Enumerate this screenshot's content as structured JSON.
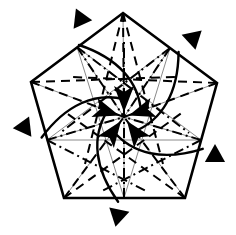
{
  "figure": {
    "shape": "regular pentagon",
    "background_color": "#ffffff",
    "ink_color": "#000000",
    "reference_line_color": "#8a8a8a",
    "symmetry": "5-fold rotational"
  },
  "diagram_data": {
    "type": "diagram",
    "canvas": {
      "width": 236,
      "height": 235
    },
    "center": {
      "x": 124,
      "y": 117
    },
    "outline": {
      "name": "pentagon-outline",
      "stroke_width": 2.6,
      "color": "#000000",
      "vertices": [
        {
          "label": "top",
          "x": 123,
          "y": 13
        },
        {
          "label": "right",
          "x": 217,
          "y": 83
        },
        {
          "label": "bottom-right",
          "x": 185,
          "y": 198
        },
        {
          "label": "bottom-left",
          "x": 64,
          "y": 198
        },
        {
          "label": "left",
          "x": 31,
          "y": 82
        }
      ]
    },
    "edge_midpoints": [
      {
        "label": "top-right-edge-mid",
        "x": 170,
        "y": 48
      },
      {
        "label": "right-lower-edge-mid",
        "x": 201,
        "y": 140
      },
      {
        "label": "bottom-edge-mid",
        "x": 124,
        "y": 198
      },
      {
        "label": "left-lower-edge-mid",
        "x": 47,
        "y": 140
      },
      {
        "label": "top-left-edge-mid",
        "x": 77,
        "y": 47
      }
    ],
    "crease_legend": [
      {
        "name": "valley-crease",
        "style": "dashed",
        "color": "#000000",
        "dash": "9,6",
        "width": 2.0
      },
      {
        "name": "mountain-crease",
        "style": "dash-dot",
        "color": "#000000",
        "dash": "10,4,2,4",
        "width": 2.0
      },
      {
        "name": "reference-line",
        "style": "solid",
        "color": "#8a8a8a",
        "dash": "none",
        "width": 1.0
      },
      {
        "name": "fold-arc-arrow",
        "style": "curved solid arrow",
        "color": "#000000",
        "width": 2.4
      },
      {
        "name": "collapse-arrow",
        "style": "straight arrow to center",
        "color": "#000000",
        "width": 2.6
      }
    ],
    "collapse_arrows": {
      "name": "center-converging-arrows",
      "count": 5,
      "direction": "inward toward center",
      "tips": [
        {
          "from_x": 124,
          "from_y": 30,
          "to_x": 124,
          "to_y": 108
        },
        {
          "from_x": 196,
          "from_y": 84,
          "to_x": 134,
          "to_y": 113
        },
        {
          "from_x": 168,
          "from_y": 176,
          "to_x": 130,
          "to_y": 124
        },
        {
          "from_x": 82,
          "from_y": 176,
          "to_x": 118,
          "to_y": 124
        },
        {
          "from_x": 52,
          "from_y": 84,
          "to_x": 114,
          "to_y": 113
        }
      ]
    },
    "edge_markers": {
      "name": "black-triangle-markers",
      "count": 5,
      "note": "solid black triangles outside each pentagon edge pointing inward",
      "items": [
        {
          "label": "marker-top-left",
          "x": 80,
          "y": 20,
          "rotation": 126,
          "size": 21
        },
        {
          "label": "marker-top-right",
          "x": 192,
          "y": 38,
          "rotation": 198,
          "size": 21
        },
        {
          "label": "marker-right",
          "x": 215,
          "y": 155,
          "rotation": 270,
          "size": 21
        },
        {
          "label": "marker-bottom",
          "x": 119,
          "y": 215,
          "rotation": 342,
          "size": 21
        },
        {
          "label": "marker-left",
          "x": 25,
          "y": 128,
          "rotation": 54,
          "size": 21
        }
      ]
    },
    "fold_arcs": {
      "name": "curved-fold-arcs",
      "count": 5,
      "note": "five congruent arcs, one per sector, rotated 72 degrees apart"
    }
  }
}
